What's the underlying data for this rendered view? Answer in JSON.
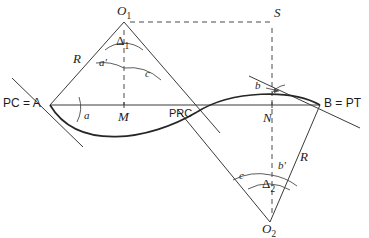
{
  "diagram": {
    "colors": {
      "line": "#3a3a3a",
      "curve": "#262626",
      "dashed": "#4a4a4a",
      "text": "#1c1c1c",
      "background": "#ffffff"
    },
    "points": [
      {
        "id": "O1",
        "label": "O",
        "subscript": "1",
        "x": 124,
        "y": 22,
        "label_x": 117,
        "label_y": 6
      },
      {
        "id": "S",
        "label": "S",
        "subscript": "",
        "x": 272,
        "y": 22,
        "label_x": 274,
        "label_y": 8
      },
      {
        "id": "A",
        "label": "PC = A",
        "subscript": "",
        "x": 50,
        "y": 105,
        "label_x": 4,
        "label_y": 99
      },
      {
        "id": "B",
        "label": "B = PT",
        "subscript": "",
        "x": 320,
        "y": 105,
        "label_x": 324,
        "label_y": 99
      },
      {
        "id": "M",
        "label": "M",
        "subscript": "",
        "x": 124,
        "y": 105,
        "label_x": 119,
        "label_y": 111
      },
      {
        "id": "PRC",
        "label": "PRC",
        "subscript": "",
        "x": 197,
        "y": 112,
        "label_x": 170,
        "label_y": 110
      },
      {
        "id": "N",
        "label": "N",
        "subscript": "",
        "x": 272,
        "y": 111,
        "label_x": 264,
        "label_y": 112
      },
      {
        "id": "O2",
        "label": "O",
        "subscript": "2",
        "x": 270,
        "y": 222,
        "label_x": 263,
        "label_y": 224
      }
    ],
    "angle_labels": [
      {
        "id": "delta1",
        "text": "Δ",
        "subscript": "1",
        "x": 119,
        "y": 40
      },
      {
        "id": "a-prime",
        "text": "a'",
        "subscript": "",
        "x": 101,
        "y": 62
      },
      {
        "id": "c-upper",
        "text": "c",
        "subscript": "",
        "x": 147,
        "y": 72
      },
      {
        "id": "a-lower",
        "text": "a",
        "subscript": "",
        "x": 85,
        "y": 113
      },
      {
        "id": "b-upper",
        "text": "b",
        "subscript": "",
        "x": 258,
        "y": 85
      },
      {
        "id": "b-prime",
        "text": "b'",
        "subscript": "",
        "x": 280,
        "y": 165
      },
      {
        "id": "delta2",
        "text": "Δ",
        "subscript": "2",
        "x": 265,
        "y": 182
      },
      {
        "id": "c-lower",
        "text": "c",
        "subscript": "",
        "x": 241,
        "y": 174
      }
    ],
    "radius_labels": [
      {
        "id": "R-upper-left",
        "text": "R",
        "x": 75,
        "y": 55
      },
      {
        "id": "R-lower-right",
        "text": "R",
        "x": 301,
        "y": 153
      }
    ],
    "notes": {
      "pc_meaning": "PC = A",
      "pt_meaning": "B = PT",
      "prc_meaning": "PRC"
    }
  }
}
